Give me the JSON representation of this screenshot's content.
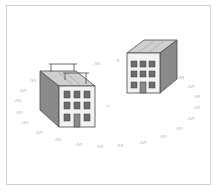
{
  "illustration": {
    "subject": "Two apartment buildings on a lawn with grass tufts arranged in an oval",
    "buildings": [
      {
        "name": "left-building",
        "floors": 3,
        "windows_per_floor": 3,
        "has_door": true,
        "roof": "pitched with antenna rails"
      },
      {
        "name": "right-building",
        "floors": 3,
        "windows_per_floor": 3,
        "has_door": true,
        "roof": "flat with ridged panels"
      }
    ],
    "colors": {
      "frame_border": "#cfcfcf",
      "wall_front": "#f2f2f2",
      "wall_side": "#8a8a8a",
      "roof": "#cfcfcf",
      "window": "#6e6e6e",
      "outline": "#4a4a4a",
      "grass": "#c8c8c8"
    }
  }
}
